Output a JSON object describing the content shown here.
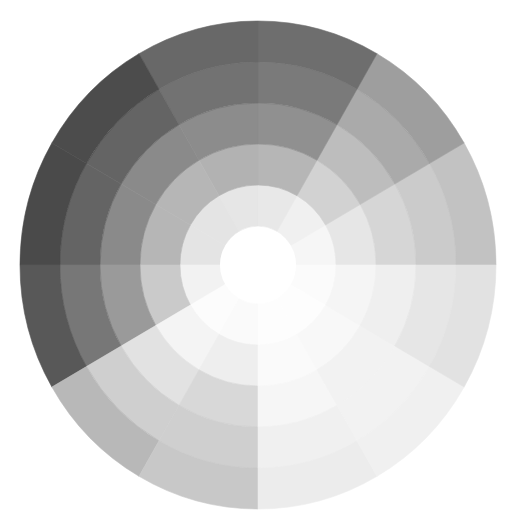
{
  "wheel": {
    "title": "Grayscale tonal wheel",
    "sector_count": 12,
    "ring_count": 5,
    "sector_angle_deg": 30,
    "background": "#ffffff",
    "center_fill": "#ffffff",
    "sectors": [
      {
        "label": "0-30",
        "start_deg": 0,
        "end_deg": 30,
        "ring_colors": [
          "#f6f6f6",
          "#e6e6e6",
          "#d6d6d6",
          "#cbcbcb",
          "#c2c2c2"
        ]
      },
      {
        "label": "30-60",
        "start_deg": 30,
        "end_deg": 60,
        "ring_colors": [
          "#f0f0f0",
          "#d2d2d2",
          "#bdbdbd",
          "#aaaaaa",
          "#9e9e9e"
        ]
      },
      {
        "label": "60-90",
        "start_deg": 60,
        "end_deg": 90,
        "ring_colors": [
          "#e8e8e8",
          "#b6b6b6",
          "#909090",
          "#7a7a7a",
          "#6e6e6e"
        ]
      },
      {
        "label": "90-120",
        "start_deg": 90,
        "end_deg": 120,
        "ring_colors": [
          "#e6e6e6",
          "#b2b2b2",
          "#8c8c8c",
          "#727272",
          "#686868"
        ]
      },
      {
        "label": "120-150",
        "start_deg": 120,
        "end_deg": 150,
        "ring_colors": [
          "#e4e4e4",
          "#b6b6b6",
          "#8a8a8a",
          "#646464",
          "#4c4c4c"
        ]
      },
      {
        "label": "150-180",
        "start_deg": 150,
        "end_deg": 180,
        "ring_colors": [
          "#e4e4e4",
          "#b6b6b6",
          "#8a8a8a",
          "#646464",
          "#4a4a4a"
        ]
      },
      {
        "label": "180-210",
        "start_deg": 180,
        "end_deg": 210,
        "ring_colors": [
          "#f2f2f2",
          "#cacaca",
          "#9a9a9a",
          "#777777",
          "#585858"
        ]
      },
      {
        "label": "210-240",
        "start_deg": 210,
        "end_deg": 240,
        "ring_colors": [
          "#fcfcfc",
          "#f4f4f4",
          "#e2e2e2",
          "#cfcfcf",
          "#b8b8b8"
        ]
      },
      {
        "label": "240-270",
        "start_deg": 240,
        "end_deg": 270,
        "ring_colors": [
          "#fafafa",
          "#eeeeee",
          "#d8d8d8",
          "#cfcfcf",
          "#c8c8c8"
        ]
      },
      {
        "label": "270-300",
        "start_deg": 270,
        "end_deg": 300,
        "ring_colors": [
          "#fdfdfd",
          "#fafafa",
          "#f6f6f6",
          "#f0f0f0",
          "#ececec"
        ]
      },
      {
        "label": "300-330",
        "start_deg": 300,
        "end_deg": 330,
        "ring_colors": [
          "#fdfdfd",
          "#f8f8f8",
          "#f2f2f2",
          "#f2f2f2",
          "#f0f0f0"
        ]
      },
      {
        "label": "330-360",
        "start_deg": 330,
        "end_deg": 360,
        "ring_colors": [
          "#fbfbfb",
          "#f5f5f5",
          "#efefef",
          "#e6e6e6",
          "#e2e2e2"
        ]
      }
    ]
  }
}
